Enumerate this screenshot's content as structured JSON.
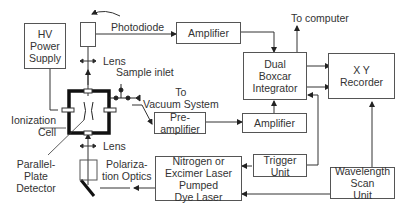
{
  "diagram": {
    "blocks": {
      "hv_power_supply": "HV\nPower\nSupply",
      "photodiode_box": "",
      "amplifier_top": "Amplifier",
      "dual_boxcar": "Dual\nBoxcar\nIntegrator",
      "xy_recorder": "X Y\nRecorder",
      "preamplifier": "Pre-\namplifier",
      "amplifier_mid": "Amplifier",
      "dye_laser": "Nitrogen or\nExcimer Laser\nPumped\nDye Laser",
      "trigger_unit": "Trigger\nUnit",
      "wavelength_scan": "Wavelength\nScan\nUnit"
    },
    "labels": {
      "photodiode": "Photodiode",
      "to_computer": "To computer",
      "lens_top": "Lens",
      "sample_inlet": "Sample inlet",
      "to_vacuum": "To\nVacuum System",
      "ionization_cell": "Ionization\nCell",
      "parallel_plate": "Parallel-\nPlate\nDetector",
      "lens_bottom": "Lens",
      "polarization_optics": "Polariza-\ntion Optics"
    },
    "colors": {
      "line": "#333333",
      "box_border": "#555555",
      "text": "#333333"
    }
  }
}
